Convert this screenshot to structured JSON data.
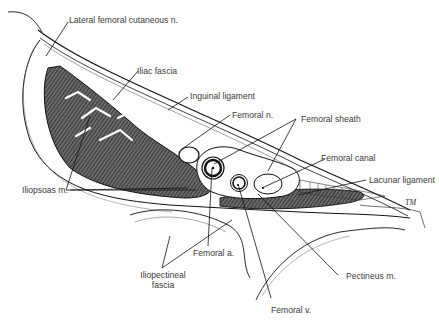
{
  "diagram": {
    "labels": {
      "lateral_femoral_cutaneous": "Lateral femoral cutaneous n.",
      "iliac_fascia": "Iliac fascia",
      "inguinal_ligament": "Inguinal ligament",
      "femoral_n": "Femoral n.",
      "femoral_sheath": "Femoral sheath",
      "femoral_canal": "Femoral canal",
      "lacunar_ligament": "Lacunar ligament",
      "iliopsoas": "Iliopsoas m.",
      "femoral_a": "Femoral a.",
      "iliopectineal_1": "Iliopectineal",
      "iliopectineal_2": "fascia",
      "pectineus": "Pectineus m.",
      "femoral_v": "Femoral v."
    },
    "signature": "TM",
    "colors": {
      "line": "#1a1a1a",
      "label": "#3a3a3a",
      "muscle": "#555555"
    }
  }
}
